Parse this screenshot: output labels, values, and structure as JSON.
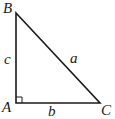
{
  "diagram": {
    "type": "right-triangle",
    "stroke_color": "#1a1a1a",
    "vertices": [
      {
        "name": "B",
        "x": 16,
        "y": 13
      },
      {
        "name": "A",
        "x": 16,
        "y": 103
      },
      {
        "name": "C",
        "x": 100,
        "y": 103
      }
    ],
    "vertex_labels": {
      "B": "B",
      "A": "A",
      "C": "C"
    },
    "side_labels": {
      "c": "c",
      "a": "a",
      "b": "b"
    },
    "right_angle_at": "A"
  }
}
